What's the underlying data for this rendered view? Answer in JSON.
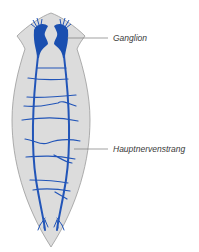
{
  "diagram": {
    "colors": {
      "body_fill": "#dcdcdc",
      "body_outline": "#9a9a9a",
      "nerve": "#2255b8",
      "ganglion": "#1a4fb0",
      "leader_line": "#7a7a7a",
      "label_text": "#3a3a3a"
    },
    "labels": [
      {
        "id": "ganglion",
        "text": "Ganglion"
      },
      {
        "id": "main-nerve-cord",
        "text": "Hauptnervenstrang"
      }
    ]
  }
}
